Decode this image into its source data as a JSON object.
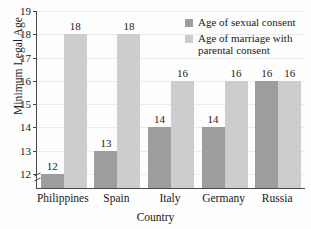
{
  "chart_data": {
    "type": "bar",
    "title": "",
    "xlabel": "Country",
    "ylabel": "Minimum Legal Age",
    "categories": [
      "Philippines",
      "Spain",
      "Italy",
      "Germany",
      "Russia"
    ],
    "series": [
      {
        "name": "Age of sexual consent",
        "color": "#9d9d9d",
        "values": [
          12,
          13,
          14,
          14,
          16
        ]
      },
      {
        "name": "Age of marriage with parental consent",
        "color": "#cdcdcd",
        "values": [
          18,
          18,
          16,
          16,
          16
        ]
      }
    ],
    "ylim": [
      11.4,
      19
    ],
    "yticks": [
      12,
      13,
      14,
      15,
      16,
      17,
      18,
      19
    ],
    "ytick_labels": [
      "12",
      "13",
      "14",
      "15",
      "16",
      "17",
      "18",
      "19"
    ],
    "grid": true,
    "axis_break": true,
    "legend_position": "top-right",
    "data_labels": [
      {
        "category": "Philippines",
        "series": "Age of sexual consent",
        "value": "12"
      },
      {
        "category": "Philippines",
        "series": "Age of marriage with parental consent",
        "value": "18"
      },
      {
        "category": "Spain",
        "series": "Age of sexual consent",
        "value": "13"
      },
      {
        "category": "Spain",
        "series": "Age of marriage with parental consent",
        "value": "18"
      },
      {
        "category": "Italy",
        "series": "Age of sexual consent",
        "value": "14"
      },
      {
        "category": "Italy",
        "series": "Age of marriage with parental consent",
        "value": "16"
      },
      {
        "category": "Germany",
        "series": "Age of sexual consent",
        "value": "14"
      },
      {
        "category": "Germany",
        "series": "Age of marriage with parental consent",
        "value": "16"
      },
      {
        "category": "Russia",
        "series": "Age of sexual consent",
        "value": "16"
      },
      {
        "category": "Russia",
        "series": "Age of marriage with parental consent",
        "value": "16"
      }
    ]
  },
  "legend": {
    "entries": [
      {
        "label": "Age of sexual consent",
        "color": "#9d9d9d"
      },
      {
        "label": "Age of marriage with parental consent",
        "color": "#cdcdcd"
      }
    ]
  }
}
